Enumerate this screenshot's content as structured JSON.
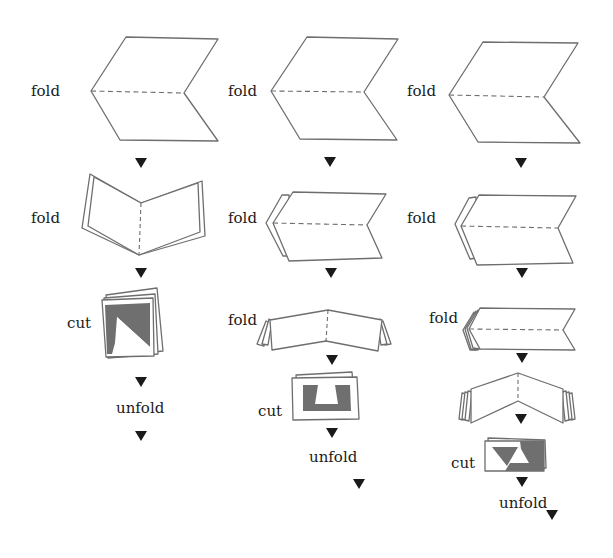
{
  "diagram": {
    "type": "paper-folding-and-cutting-instructions",
    "colors": {
      "line": "#6e6e6e",
      "cut_fill": "#6f6f6f",
      "arrow": "#1a1a1a",
      "text": "#1a1a1a",
      "background": "#ffffff"
    },
    "columns": [
      {
        "id": "column-1",
        "steps": [
          {
            "label": "fold",
            "figure": "sheet-with-horizontal-crease"
          },
          {
            "label": "fold",
            "figure": "folded-in-half-vertical-crease"
          },
          {
            "label": "cut",
            "figure": "folded-square-with-triangle-cut"
          },
          {
            "label": "unfold",
            "figure": "none"
          }
        ]
      },
      {
        "id": "column-2",
        "steps": [
          {
            "label": "fold",
            "figure": "sheet-with-horizontal-crease"
          },
          {
            "label": "fold",
            "figure": "folded-in-half-horizontal-crease"
          },
          {
            "label": "fold",
            "figure": "folded-quarters-vertical-crease"
          },
          {
            "label": "cut",
            "figure": "folded-rectangle-with-trapezoid-cuts"
          },
          {
            "label": "unfold",
            "figure": "none"
          }
        ]
      },
      {
        "id": "column-3",
        "steps": [
          {
            "label": "fold",
            "figure": "sheet-with-horizontal-crease"
          },
          {
            "label": "fold",
            "figure": "folded-in-half-horizontal-crease"
          },
          {
            "label": "fold",
            "figure": "folded-quarters-horizontal-crease"
          },
          {
            "label": "",
            "figure": "folded-eighths-vertical-crease"
          },
          {
            "label": "cut",
            "figure": "folded-rectangle-with-triangle-cuts"
          },
          {
            "label": "unfold",
            "figure": "none"
          }
        ]
      }
    ],
    "arrow_icon": "down-triangle"
  }
}
